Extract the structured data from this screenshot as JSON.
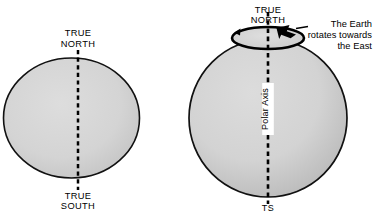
{
  "diagram": {
    "background_color": "#ffffff",
    "stroke_color": "#000000",
    "globe_fill_color": "#d4d4d4",
    "globe_edge_shade_color": "#9a9a9a",
    "left_figure": {
      "name": "ellipse-globe-flat",
      "top_label_line1": "TRUE",
      "top_label_line2": "NORTH",
      "bottom_label_line1": "TRUE",
      "bottom_label_line2": "SOUTH",
      "axis_style": "dashed"
    },
    "right_figure": {
      "name": "sphere-globe-rotating",
      "top_label_line1": "TRUE",
      "top_label_line2": "NORTH",
      "bottom_label": "TS",
      "axis_label": "Polar Axis",
      "axis_style": "dashed",
      "rotation_note_line1": "The Earth",
      "rotation_note_line2": "rotates towards",
      "rotation_note_line3": "the East",
      "rotation_ring": "rotation-arrow-ellipse"
    }
  }
}
